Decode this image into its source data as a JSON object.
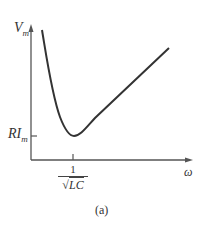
{
  "figure": {
    "y_axis_label": "V",
    "y_axis_label_sub": "m",
    "x_axis_label": "ω",
    "y_tick_label": "RI",
    "y_tick_label_sub": "m",
    "x_tick_numerator": "1",
    "x_tick_radical": "√",
    "x_tick_denominator": "LC",
    "caption": "(a)"
  },
  "colors": {
    "axis": "#555555",
    "curve": "#333333"
  }
}
